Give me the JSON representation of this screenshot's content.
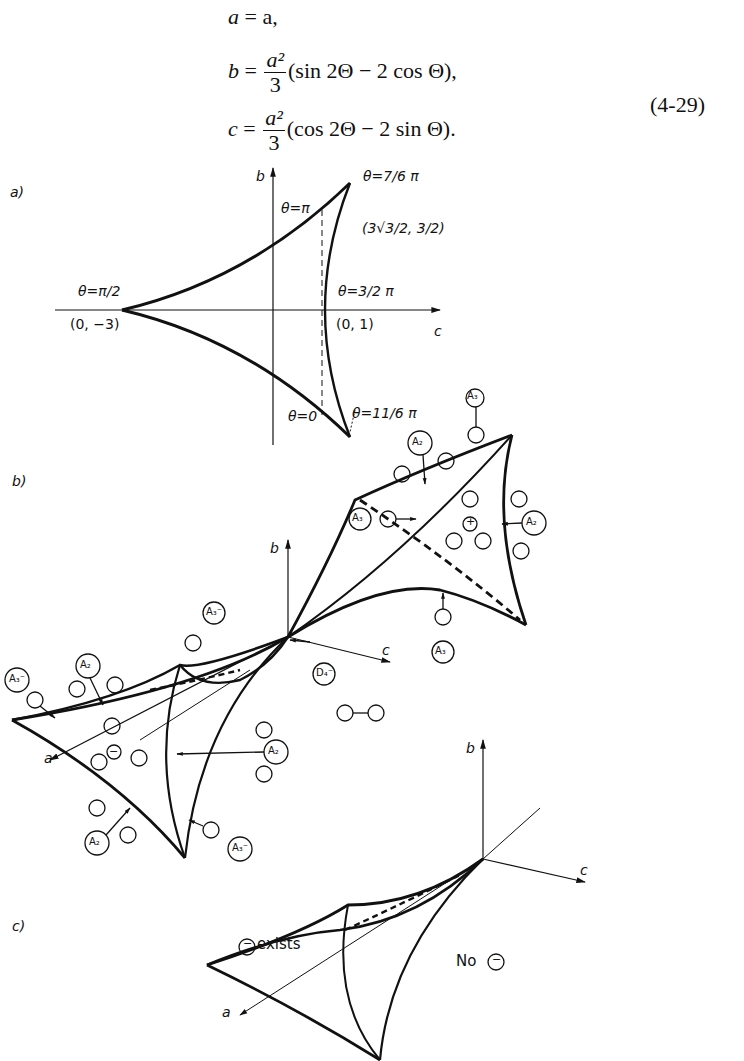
{
  "equations": {
    "line1": {
      "lhs": "a",
      "rhs": "= a,"
    },
    "line2": {
      "lhs": "b",
      "num": "a²",
      "den": "3",
      "rest": "(sin 2Θ − 2 cos Θ),"
    },
    "line3": {
      "lhs": "c",
      "num": "a²",
      "den": "3",
      "rest": "(cos 2Θ − 2 sin Θ)."
    },
    "number": "(4-29)"
  },
  "panel_a": {
    "label": "a)",
    "axis_b": "b",
    "axis_c": "c",
    "theta_pi_half": "θ=π/2",
    "theta_pi": "θ=π",
    "theta_7_6": "θ=7/6 π",
    "point_cusp": "(3√3/2, 3/2)",
    "theta_3_2": "θ=3/2 π",
    "theta_0": "θ=0",
    "theta_11_6": "θ=11/6 π",
    "point_left": "(0, −3)",
    "point_right": "(0, 1)"
  },
  "panel_b": {
    "label": "b)",
    "axis_a": "a",
    "axis_b": "b",
    "axis_c": "c",
    "labels": {
      "A2": "A₂",
      "A3": "A₃",
      "A3m": "A₃⁻",
      "D4m": "D₄⁻",
      "plus": "+",
      "minus": "−"
    }
  },
  "panel_c": {
    "label": "c)",
    "axis_a": "a",
    "axis_b": "b",
    "axis_c": "c",
    "exists": "exists",
    "no": "No",
    "minus": "−"
  }
}
